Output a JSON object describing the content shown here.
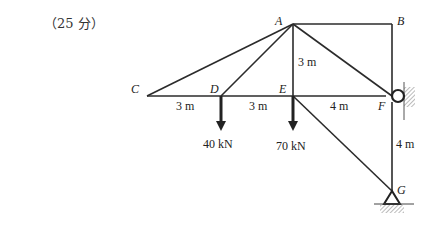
{
  "header": {
    "score": "（25 分）"
  },
  "nodes": {
    "A": {
      "label": "A",
      "x": 293,
      "y": 24
    },
    "B": {
      "label": "B",
      "x": 392,
      "y": 24
    },
    "C": {
      "label": "C",
      "x": 147,
      "y": 96
    },
    "D": {
      "label": "D",
      "x": 221,
      "y": 96
    },
    "E": {
      "label": "E",
      "x": 293,
      "y": 96
    },
    "F": {
      "label": "F",
      "x": 392,
      "y": 96
    },
    "G": {
      "label": "G",
      "x": 392,
      "y": 191
    }
  },
  "members": [
    [
      "A",
      "B"
    ],
    [
      "B",
      "F"
    ],
    [
      "A",
      "C"
    ],
    [
      "A",
      "D"
    ],
    [
      "A",
      "E"
    ],
    [
      "A",
      "F"
    ],
    [
      "C",
      "D"
    ],
    [
      "D",
      "E"
    ],
    [
      "E",
      "F"
    ],
    [
      "E",
      "G"
    ],
    [
      "F",
      "G"
    ]
  ],
  "dimensions": {
    "CD": "3 m",
    "DE": "3 m",
    "EF": "4 m",
    "AE": "3 m",
    "FG": "4 m"
  },
  "loads": {
    "D": "40 kN",
    "E": "70 kN"
  },
  "supports": {
    "F": "roller-wall",
    "G": "pin-ground"
  },
  "colors": {
    "line": "#2b2b2b",
    "hatch": "#777777"
  }
}
